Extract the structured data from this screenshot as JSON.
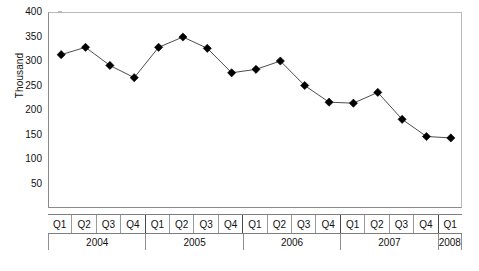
{
  "chart_data": {
    "type": "line",
    "title": "",
    "subtitle": "",
    "xlabel": "",
    "ylabel": "Thousand",
    "ylim": [
      0,
      400
    ],
    "ytick_step": 50,
    "grid": false,
    "legend": "none",
    "marker": "diamond",
    "marker_color": "#000000",
    "line_color": "#4d4d4d",
    "categories": [
      "Q1",
      "Q2",
      "Q3",
      "Q4",
      "Q1",
      "Q2",
      "Q3",
      "Q4",
      "Q1",
      "Q2",
      "Q3",
      "Q4",
      "Q1",
      "Q2",
      "Q3",
      "Q4",
      "Q1"
    ],
    "values": [
      315,
      330,
      293,
      268,
      330,
      351,
      328,
      278,
      285,
      302,
      252,
      218,
      216,
      238,
      183,
      148,
      145
    ],
    "ytick_labels": [
      "400",
      "350",
      "300",
      "250",
      "200",
      "150",
      "100",
      "50"
    ],
    "ytick_values": [
      400,
      350,
      300,
      250,
      200,
      150,
      100,
      50
    ],
    "year_groups": [
      {
        "label": "2004",
        "quarters": 4
      },
      {
        "label": "2005",
        "quarters": 4
      },
      {
        "label": "2006",
        "quarters": 4
      },
      {
        "label": "2007",
        "quarters": 4
      },
      {
        "label": "2008",
        "quarters": 1
      }
    ]
  }
}
